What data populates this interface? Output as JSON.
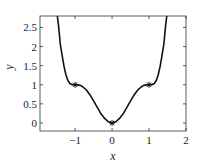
{
  "chart_data": {
    "type": "line",
    "title": "",
    "xlabel": "x",
    "ylabel": "y",
    "xlim": [
      -1.95,
      2
    ],
    "ylim": [
      -0.21,
      2.8
    ],
    "grid": false,
    "legend": null,
    "xticks": [
      -1,
      0,
      1,
      2
    ],
    "xtick_labels": [
      "−1",
      "0",
      "1",
      "2"
    ],
    "yticks": [
      0,
      0.5,
      1,
      1.5,
      2,
      2.5
    ],
    "ytick_labels": [
      "0",
      "0.5",
      "1",
      "1.5",
      "2",
      "2.5"
    ],
    "series": [
      {
        "name": "curve",
        "description": "smooth even curve, y = 1 - (1 - x^2)^3, flat shoulders at x = ±1",
        "color": "#111111",
        "x": [
          -1.56,
          -1.5,
          -1.45,
          -1.4,
          -1.35,
          -1.3,
          -1.25,
          -1.2,
          -1.15,
          -1.1,
          -1.05,
          -1.0,
          -0.95,
          -0.9,
          -0.85,
          -0.8,
          -0.7,
          -0.6,
          -0.5,
          -0.4,
          -0.3,
          -0.2,
          -0.1,
          0.0,
          0.1,
          0.2,
          0.3,
          0.4,
          0.5,
          0.6,
          0.7,
          0.8,
          0.85,
          0.9,
          0.95,
          1.0,
          1.05,
          1.1,
          1.15,
          1.2,
          1.25,
          1.3,
          1.35,
          1.4,
          1.45,
          1.5,
          1.56
        ],
        "y": [
          3.47,
          2.95,
          2.56,
          2.06,
          1.76,
          1.48,
          1.27,
          1.12,
          1.04,
          1.01,
          1.0,
          1.0,
          1.0,
          0.99,
          0.98,
          0.95,
          0.87,
          0.74,
          0.58,
          0.41,
          0.24,
          0.12,
          0.03,
          0.0,
          0.03,
          0.12,
          0.24,
          0.41,
          0.58,
          0.74,
          0.87,
          0.95,
          0.98,
          0.99,
          1.0,
          1.0,
          1.0,
          1.01,
          1.04,
          1.12,
          1.27,
          1.48,
          1.76,
          2.06,
          2.56,
          2.95,
          3.47
        ]
      },
      {
        "name": "markers",
        "marker": "asterisk",
        "color": "#111111",
        "x": [
          -1,
          0,
          1
        ],
        "y": [
          1,
          0,
          1
        ]
      }
    ]
  }
}
